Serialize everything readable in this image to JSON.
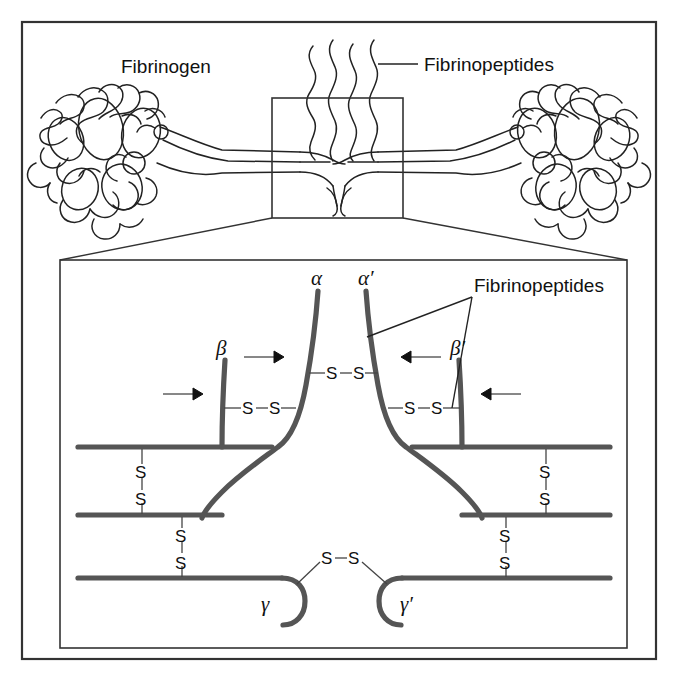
{
  "figure": {
    "title_top_left": "Fibrinogen",
    "label_fibrinopeptides_top": "Fibrinopeptides",
    "label_fibrinopeptides_detail": "Fibrinopeptides",
    "colors": {
      "outline": "#222222",
      "chain": "#555555",
      "frame": "#333333",
      "background": "#ffffff"
    }
  },
  "chain_labels": {
    "alpha": "α",
    "alpha_prime": "α′",
    "beta": "β",
    "beta_prime": "β′",
    "gamma": "γ",
    "gamma_prime": "γ′"
  },
  "disulfide_bonds": {
    "horizontal_label_left": "S",
    "horizontal_label_right": "S",
    "pairs": [
      {
        "id": "alpha-alpha-upper",
        "left": "S",
        "right": "S",
        "orientation": "horizontal"
      },
      {
        "id": "beta-alpha-left",
        "left": "S",
        "right": "S",
        "orientation": "horizontal"
      },
      {
        "id": "beta-alpha-right",
        "left": "S",
        "right": "S",
        "orientation": "horizontal"
      },
      {
        "id": "gamma-gamma-center",
        "left": "S",
        "right": "S",
        "orientation": "horizontal"
      },
      {
        "id": "left-upper-vertical",
        "top": "S",
        "bottom": "S",
        "orientation": "vertical"
      },
      {
        "id": "left-lower-vertical",
        "top": "S",
        "bottom": "S",
        "orientation": "vertical"
      },
      {
        "id": "right-upper-vertical",
        "top": "S",
        "bottom": "S",
        "orientation": "vertical"
      },
      {
        "id": "right-lower-vertical",
        "top": "S",
        "bottom": "S",
        "orientation": "vertical"
      }
    ]
  },
  "cleavage_arrows": [
    {
      "id": "arrow-beta-left",
      "direction": "right"
    },
    {
      "id": "arrow-alpha-left",
      "direction": "right"
    },
    {
      "id": "arrow-alpha-right",
      "direction": "left"
    },
    {
      "id": "arrow-beta-right",
      "direction": "left"
    }
  ]
}
